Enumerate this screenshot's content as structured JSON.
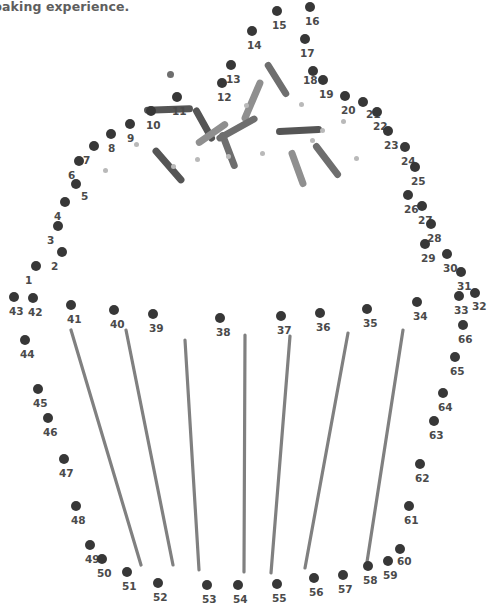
{
  "page": {
    "header_text": "baking experience.",
    "width": 487,
    "height": 611,
    "background": "#ffffff"
  },
  "colors": {
    "dot": "#373737",
    "label": "#4a4a4a",
    "header": "#5e5e5e",
    "wrapper_line": "#808080",
    "minidot": "#b9b9b9",
    "sprinkle_dark": "#555555",
    "sprinkle_mid": "#6e6e6e",
    "sprinkle_light": "#8f8f8f"
  },
  "puzzle": {
    "total_dots": 66,
    "dot_radius": 5,
    "dots": [
      {
        "n": "1",
        "x": 36,
        "y": 266,
        "lx": -11,
        "ly": 9
      },
      {
        "n": "2",
        "x": 62,
        "y": 252,
        "lx": -11,
        "ly": 9
      },
      {
        "n": "3",
        "x": 58,
        "y": 226,
        "lx": -11,
        "ly": 9
      },
      {
        "n": "4",
        "x": 65,
        "y": 202,
        "lx": -11,
        "ly": 9
      },
      {
        "n": "5",
        "x": 76,
        "y": 184,
        "lx": 5,
        "ly": 7
      },
      {
        "n": "6",
        "x": 79,
        "y": 161,
        "lx": -11,
        "ly": 9
      },
      {
        "n": "7",
        "x": 94,
        "y": 146,
        "lx": -11,
        "ly": 9
      },
      {
        "n": "8",
        "x": 111,
        "y": 134,
        "lx": -3,
        "ly": 9
      },
      {
        "n": "9",
        "x": 130,
        "y": 124,
        "lx": -3,
        "ly": 9
      },
      {
        "n": "10",
        "x": 151,
        "y": 111,
        "lx": -5,
        "ly": 9
      },
      {
        "n": "11",
        "x": 177,
        "y": 97,
        "lx": -5,
        "ly": 9
      },
      {
        "n": "12",
        "x": 222,
        "y": 83,
        "lx": -5,
        "ly": 9
      },
      {
        "n": "13",
        "x": 231,
        "y": 65,
        "lx": -5,
        "ly": 9
      },
      {
        "n": "14",
        "x": 252,
        "y": 31,
        "lx": -5,
        "ly": 9
      },
      {
        "n": "15",
        "x": 277,
        "y": 11,
        "lx": -5,
        "ly": 9
      },
      {
        "n": "16",
        "x": 310,
        "y": 7,
        "lx": -5,
        "ly": 9
      },
      {
        "n": "17",
        "x": 305,
        "y": 39,
        "lx": -5,
        "ly": 9
      },
      {
        "n": "18",
        "x": 313,
        "y": 71,
        "lx": -10,
        "ly": 4
      },
      {
        "n": "19",
        "x": 323,
        "y": 80,
        "lx": -4,
        "ly": 9
      },
      {
        "n": "20",
        "x": 345,
        "y": 96,
        "lx": -4,
        "ly": 9
      },
      {
        "n": "21",
        "x": 363,
        "y": 102,
        "lx": 3,
        "ly": 7
      },
      {
        "n": "22",
        "x": 377,
        "y": 112,
        "lx": -4,
        "ly": 9
      },
      {
        "n": "23",
        "x": 388,
        "y": 131,
        "lx": -4,
        "ly": 9
      },
      {
        "n": "24",
        "x": 405,
        "y": 147,
        "lx": -4,
        "ly": 9
      },
      {
        "n": "25",
        "x": 415,
        "y": 167,
        "lx": -4,
        "ly": 9
      },
      {
        "n": "26",
        "x": 408,
        "y": 195,
        "lx": -4,
        "ly": 9
      },
      {
        "n": "27",
        "x": 422,
        "y": 206,
        "lx": -4,
        "ly": 9
      },
      {
        "n": "28",
        "x": 431,
        "y": 224,
        "lx": -4,
        "ly": 9
      },
      {
        "n": "29",
        "x": 425,
        "y": 244,
        "lx": -4,
        "ly": 9
      },
      {
        "n": "30",
        "x": 447,
        "y": 254,
        "lx": -4,
        "ly": 9
      },
      {
        "n": "31",
        "x": 461,
        "y": 272,
        "lx": -4,
        "ly": 9
      },
      {
        "n": "32",
        "x": 475,
        "y": 293,
        "lx": -3,
        "ly": 8
      },
      {
        "n": "33",
        "x": 459,
        "y": 296,
        "lx": -5,
        "ly": 9
      },
      {
        "n": "34",
        "x": 417,
        "y": 302,
        "lx": -4,
        "ly": 9
      },
      {
        "n": "35",
        "x": 367,
        "y": 309,
        "lx": -4,
        "ly": 9
      },
      {
        "n": "36",
        "x": 320,
        "y": 313,
        "lx": -4,
        "ly": 9
      },
      {
        "n": "37",
        "x": 281,
        "y": 316,
        "lx": -4,
        "ly": 9
      },
      {
        "n": "38",
        "x": 220,
        "y": 318,
        "lx": -4,
        "ly": 9
      },
      {
        "n": "39",
        "x": 153,
        "y": 314,
        "lx": -4,
        "ly": 9
      },
      {
        "n": "40",
        "x": 114,
        "y": 310,
        "lx": -4,
        "ly": 9
      },
      {
        "n": "41",
        "x": 71,
        "y": 305,
        "lx": -4,
        "ly": 9
      },
      {
        "n": "42",
        "x": 33,
        "y": 298,
        "lx": -5,
        "ly": 9
      },
      {
        "n": "43",
        "x": 14,
        "y": 297,
        "lx": -5,
        "ly": 9
      },
      {
        "n": "44",
        "x": 25,
        "y": 340,
        "lx": -5,
        "ly": 9
      },
      {
        "n": "45",
        "x": 38,
        "y": 389,
        "lx": -5,
        "ly": 9
      },
      {
        "n": "46",
        "x": 48,
        "y": 418,
        "lx": -5,
        "ly": 9
      },
      {
        "n": "47",
        "x": 64,
        "y": 459,
        "lx": -5,
        "ly": 9
      },
      {
        "n": "48",
        "x": 76,
        "y": 506,
        "lx": -5,
        "ly": 9
      },
      {
        "n": "49",
        "x": 90,
        "y": 545,
        "lx": -5,
        "ly": 9
      },
      {
        "n": "50",
        "x": 102,
        "y": 559,
        "lx": -5,
        "ly": 9
      },
      {
        "n": "51",
        "x": 127,
        "y": 572,
        "lx": -5,
        "ly": 9
      },
      {
        "n": "52",
        "x": 158,
        "y": 583,
        "lx": -5,
        "ly": 9
      },
      {
        "n": "53",
        "x": 207,
        "y": 585,
        "lx": -5,
        "ly": 9
      },
      {
        "n": "54",
        "x": 238,
        "y": 585,
        "lx": -5,
        "ly": 9
      },
      {
        "n": "55",
        "x": 277,
        "y": 584,
        "lx": -5,
        "ly": 9
      },
      {
        "n": "56",
        "x": 314,
        "y": 578,
        "lx": -5,
        "ly": 9
      },
      {
        "n": "57",
        "x": 343,
        "y": 575,
        "lx": -5,
        "ly": 9
      },
      {
        "n": "58",
        "x": 368,
        "y": 566,
        "lx": -5,
        "ly": 9
      },
      {
        "n": "59",
        "x": 388,
        "y": 561,
        "lx": -5,
        "ly": 9
      },
      {
        "n": "60",
        "x": 400,
        "y": 549,
        "lx": -3,
        "ly": 7
      },
      {
        "n": "61",
        "x": 409,
        "y": 506,
        "lx": -5,
        "ly": 9
      },
      {
        "n": "62",
        "x": 420,
        "y": 464,
        "lx": -5,
        "ly": 9
      },
      {
        "n": "63",
        "x": 434,
        "y": 421,
        "lx": -5,
        "ly": 9
      },
      {
        "n": "64",
        "x": 443,
        "y": 393,
        "lx": -5,
        "ly": 9
      },
      {
        "n": "65",
        "x": 455,
        "y": 357,
        "lx": -5,
        "ly": 9
      },
      {
        "n": "66",
        "x": 463,
        "y": 325,
        "lx": -5,
        "ly": 9
      }
    ],
    "wrapper_lines": [
      {
        "x1": 71,
        "y1": 330,
        "x2": 141,
        "y2": 565
      },
      {
        "x1": 126,
        "y1": 330,
        "x2": 173,
        "y2": 565
      },
      {
        "x1": 185,
        "y1": 340,
        "x2": 199,
        "y2": 570
      },
      {
        "x1": 245,
        "y1": 335,
        "x2": 244,
        "y2": 572
      },
      {
        "x1": 290,
        "y1": 336,
        "x2": 271,
        "y2": 573
      },
      {
        "x1": 348,
        "y1": 333,
        "x2": 305,
        "y2": 568
      },
      {
        "x1": 403,
        "y1": 330,
        "x2": 367,
        "y2": 562
      }
    ],
    "sprinkles": [
      {
        "x": 168,
        "y": 109,
        "w": 49,
        "h": 7,
        "rot": -2,
        "tone": "sprinkle_dark"
      },
      {
        "x": 170,
        "y": 74,
        "w": 7,
        "h": 0,
        "rot": 0,
        "tone": "sprinkle_mid"
      },
      {
        "x": 204,
        "y": 124,
        "w": 38,
        "h": 7,
        "rot": 61,
        "tone": "sprinkle_dark"
      },
      {
        "x": 252,
        "y": 100,
        "w": 45,
        "h": 7,
        "rot": -67,
        "tone": "sprinkle_light"
      },
      {
        "x": 212,
        "y": 133,
        "w": 38,
        "h": 7,
        "rot": -35,
        "tone": "sprinkle_light"
      },
      {
        "x": 168,
        "y": 165,
        "w": 45,
        "h": 7,
        "rot": 49,
        "tone": "sprinkle_dark"
      },
      {
        "x": 228,
        "y": 150,
        "w": 39,
        "h": 7,
        "rot": 69,
        "tone": "sprinkle_mid"
      },
      {
        "x": 237,
        "y": 128,
        "w": 46,
        "h": 7,
        "rot": -29,
        "tone": "sprinkle_mid"
      },
      {
        "x": 299,
        "y": 130,
        "w": 46,
        "h": 7,
        "rot": -3,
        "tone": "sprinkle_dark"
      },
      {
        "x": 297,
        "y": 168,
        "w": 39,
        "h": 7,
        "rot": 70,
        "tone": "sprinkle_light"
      },
      {
        "x": 327,
        "y": 160,
        "w": 42,
        "h": 7,
        "rot": 53,
        "tone": "sprinkle_mid"
      },
      {
        "x": 277,
        "y": 79,
        "w": 40,
        "h": 7,
        "rot": 58,
        "tone": "sprinkle_mid"
      }
    ],
    "mini_dots": [
      {
        "x": 105,
        "y": 170,
        "r": 2.5
      },
      {
        "x": 136,
        "y": 144,
        "r": 2.5
      },
      {
        "x": 173,
        "y": 166,
        "r": 2.5
      },
      {
        "x": 197,
        "y": 159,
        "r": 2.5
      },
      {
        "x": 228,
        "y": 156,
        "r": 2.5
      },
      {
        "x": 246,
        "y": 105,
        "r": 2.5
      },
      {
        "x": 301,
        "y": 104,
        "r": 2.5
      },
      {
        "x": 312,
        "y": 140,
        "r": 2.5
      },
      {
        "x": 322,
        "y": 130,
        "r": 2.5
      },
      {
        "x": 356,
        "y": 158,
        "r": 2.5
      },
      {
        "x": 262,
        "y": 153,
        "r": 2.5
      },
      {
        "x": 343,
        "y": 121,
        "r": 2.5
      }
    ]
  }
}
